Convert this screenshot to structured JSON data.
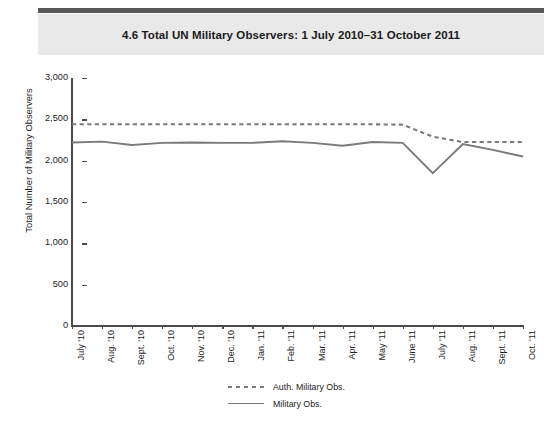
{
  "header": {
    "title": "4.6  Total UN Military Observers: 1 July 2010–31 October 2011"
  },
  "chart_data": {
    "type": "line",
    "title": "4.6  Total UN Military Observers: 1 July 2010–31 October 2011",
    "xlabel": "",
    "ylabel": "Total Number of Military Observers",
    "ylim": [
      0,
      3000
    ],
    "yticks": [
      "0",
      "500",
      "1,000",
      "1,500",
      "2,000",
      "2,500",
      "3,000"
    ],
    "ytick_values": [
      0,
      500,
      1000,
      1500,
      2000,
      2500,
      3000
    ],
    "grid": false,
    "legend_position": "bottom-center",
    "categories": [
      "July '10",
      "Aug. '10",
      "Sept. '10",
      "Oct. '10",
      "Nov. '10",
      "Dec. '10",
      "Jan. '11",
      "Feb. '11",
      "Mar. '11",
      "Apr. '11",
      "May '11",
      "June '11",
      "July '11",
      "Aug. '11",
      "Sept. '11",
      "Oct. '11"
    ],
    "series": [
      {
        "name": "Auth. Military Obs.",
        "style": "dashed",
        "color": "#7a7a7a",
        "values": [
          2440,
          2440,
          2440,
          2440,
          2440,
          2440,
          2440,
          2440,
          2440,
          2440,
          2440,
          2435,
          2290,
          2225,
          2225,
          2225
        ]
      },
      {
        "name": "Military Obs.",
        "style": "solid",
        "color": "#7a7a7a",
        "values": [
          2220,
          2230,
          2190,
          2215,
          2220,
          2215,
          2215,
          2235,
          2215,
          2180,
          2225,
          2215,
          1850,
          2200,
          2130,
          2050
        ]
      }
    ]
  },
  "legend": {
    "items": [
      {
        "label": "Auth. Military Obs.",
        "style": "dashed"
      },
      {
        "label": "Military Obs.",
        "style": "solid"
      }
    ]
  },
  "colors": {
    "line": "#7a7a7a",
    "axis": "#4a4a4a",
    "title_band": "#e9e9e9",
    "top_rule": "#585858",
    "text": "#1b1b1b"
  }
}
